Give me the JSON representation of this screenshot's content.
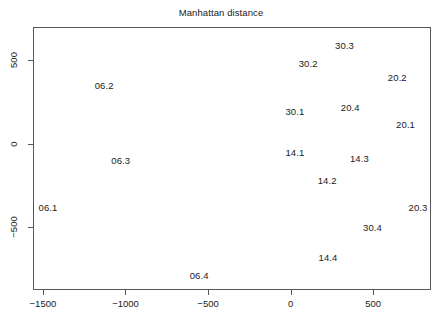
{
  "chart_data": {
    "type": "scatter",
    "title": "Manhattan distance",
    "xlabel": "",
    "ylabel": "",
    "xlim": [
      -1560,
      850
    ],
    "ylim": [
      -880,
      700
    ],
    "grid": false,
    "legend": "none",
    "marker_style": "text-labels",
    "xticks": [
      -1500,
      -1000,
      -500,
      0,
      500
    ],
    "xtick_labels": [
      "−1500",
      "−1000",
      "−500",
      "0",
      "500"
    ],
    "yticks": [
      500,
      0,
      -500
    ],
    "ytick_labels": [
      "500",
      "0",
      "−500"
    ],
    "labels": [
      "30.3",
      "30.2",
      "20.2",
      "06.2",
      "30.1",
      "20.4",
      "20.1",
      "14.1",
      "14.3",
      "06.3",
      "14.2",
      "06.1",
      "20.3",
      "30.4",
      "14.4",
      "06.4"
    ],
    "points": [
      {
        "label": "30.3",
        "x": 320,
        "y": 597
      },
      {
        "label": "30.2",
        "x": 100,
        "y": 487
      },
      {
        "label": "20.2",
        "x": 640,
        "y": 408
      },
      {
        "label": "06.2",
        "x": -1135,
        "y": 360
      },
      {
        "label": "30.1",
        "x": 20,
        "y": 201
      },
      {
        "label": "20.4",
        "x": 355,
        "y": 225
      },
      {
        "label": "20.1",
        "x": 690,
        "y": 121
      },
      {
        "label": "14.1",
        "x": 20,
        "y": -42
      },
      {
        "label": "14.3",
        "x": 410,
        "y": -79
      },
      {
        "label": "06.3",
        "x": -1035,
        "y": -91
      },
      {
        "label": "14.2",
        "x": 215,
        "y": -213
      },
      {
        "label": "06.1",
        "x": -1475,
        "y": -378
      },
      {
        "label": "20.3",
        "x": 765,
        "y": -378
      },
      {
        "label": "30.4",
        "x": 490,
        "y": -494
      },
      {
        "label": "14.4",
        "x": 220,
        "y": -676
      },
      {
        "label": "06.4",
        "x": -560,
        "y": -785
      }
    ]
  }
}
